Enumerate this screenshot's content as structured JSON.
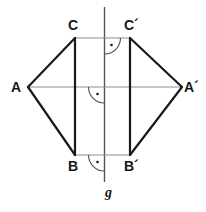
{
  "figure": {
    "colors": {
      "stroke_dark": "#1a1a1a",
      "stroke_light": "#8d8d8d",
      "axis": "#555555",
      "background": "#ffffff",
      "label": "#161616"
    },
    "axis": {
      "name": "g",
      "label": "g",
      "x": 104.5,
      "y_top": 7,
      "y_bottom": 182,
      "label_x": 105,
      "label_y": 186
    },
    "points": [
      {
        "id": "C",
        "label": "C",
        "x": 75,
        "y": 38,
        "label_x": 68,
        "label_y": 18
      },
      {
        "id": "Cp",
        "label": "C´",
        "x": 130,
        "y": 38,
        "label_x": 124,
        "label_y": 18
      },
      {
        "id": "A",
        "label": "A",
        "x": 28,
        "y": 87,
        "label_x": 11,
        "label_y": 80
      },
      {
        "id": "Ap",
        "label": "A´",
        "x": 182,
        "y": 87,
        "label_x": 184,
        "label_y": 80
      },
      {
        "id": "B",
        "label": "B",
        "x": 75,
        "y": 155,
        "label_x": 68,
        "label_y": 159
      },
      {
        "id": "Bp",
        "label": "B´",
        "x": 130,
        "y": 155,
        "label_x": 124,
        "label_y": 159
      }
    ],
    "segments": [
      {
        "name": "A-C",
        "from": "A",
        "to": "C",
        "weight": "thick"
      },
      {
        "name": "A-B",
        "from": "A",
        "to": "B",
        "weight": "thick"
      },
      {
        "name": "C-B",
        "from": "C",
        "to": "B",
        "weight": "thick"
      },
      {
        "name": "Ap-Cp",
        "from": "Ap",
        "to": "Cp",
        "weight": "thick"
      },
      {
        "name": "Ap-Bp",
        "from": "Ap",
        "to": "Bp",
        "weight": "thick"
      },
      {
        "name": "Cp-Bp",
        "from": "Cp",
        "to": "Bp",
        "weight": "thick"
      },
      {
        "name": "C-Cp",
        "from": "C",
        "to": "Cp",
        "weight": "thin"
      },
      {
        "name": "A-Ap",
        "from": "A",
        "to": "Ap",
        "weight": "thin"
      },
      {
        "name": "B-Bp",
        "from": "B",
        "to": "Bp",
        "weight": "thin"
      }
    ],
    "right_angle_marks": [
      {
        "name": "right-angle-at-CCp",
        "cx": 104.5,
        "cy": 38,
        "radius": 16,
        "quadrant": "lower-right"
      },
      {
        "name": "right-angle-at-AAp",
        "cx": 104.5,
        "cy": 87,
        "radius": 16,
        "quadrant": "lower-left"
      },
      {
        "name": "right-angle-at-BBp",
        "cx": 104.5,
        "cy": 155,
        "radius": 16,
        "quadrant": "lower-left"
      }
    ]
  }
}
